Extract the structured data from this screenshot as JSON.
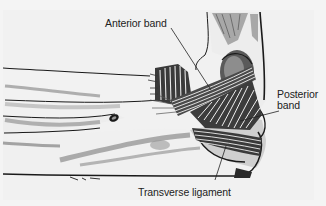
{
  "figure": {
    "labels": {
      "anterior_band": "Anterior band",
      "posterior_band_line1": "Posterior",
      "posterior_band_line2": "band",
      "transverse_ligament": "Transverse ligament"
    },
    "colors": {
      "background": "#f4f4f4",
      "ink": "#1a1a1a",
      "shade": "#6a6a6a",
      "light_shade": "#b5b5b5"
    }
  }
}
